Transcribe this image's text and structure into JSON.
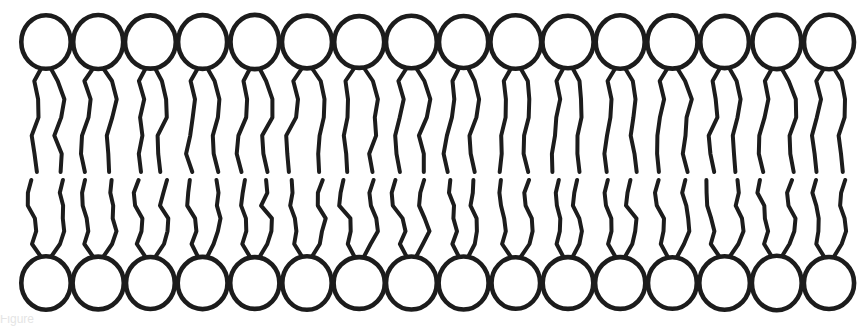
{
  "figure": {
    "width": 859,
    "height": 326,
    "background_color": "#ffffff",
    "stroke_color": "#1c1c1c"
  },
  "caption": {
    "text": "Figure",
    "visible": "partial"
  },
  "chart_data": {
    "type": "diagram",
    "xlabel": "",
    "ylabel": "",
    "leaflets": [
      {
        "name": "upper-leaflet",
        "head_count": 16,
        "head_center_y": 42,
        "head_radius": 25,
        "tails_per_lipid": 2,
        "tail_start_y": 67,
        "tail_end_y": 172,
        "orientation": "heads-up"
      },
      {
        "name": "lower-leaflet",
        "head_count": 16,
        "head_center_y": 283,
        "head_radius": 25,
        "tails_per_lipid": 2,
        "tail_start_y": 180,
        "tail_end_y": 258,
        "orientation": "heads-down"
      }
    ],
    "lipid_pitch": 52.2,
    "first_lipid_center_x": 46,
    "hydrophobic_gap": [
      172,
      180
    ],
    "grid": false,
    "legend": false
  }
}
